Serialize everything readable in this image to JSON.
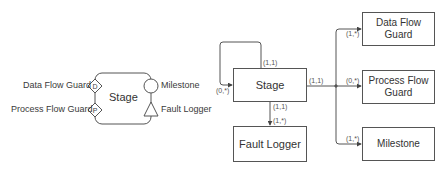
{
  "left_diagram": {
    "stage_label": "Stage",
    "ports": {
      "data_flow_guard": {
        "label": "Data Flow Guard",
        "glyph": "D",
        "shape": "diamond"
      },
      "process_flow_guard": {
        "label": "Process Flow Guard",
        "glyph": "P",
        "shape": "diamond"
      },
      "milestone": {
        "label": "Milestone",
        "shape": "circle"
      },
      "fault_logger": {
        "label": "Fault Logger",
        "shape": "triangle"
      }
    }
  },
  "right_diagram": {
    "stage": {
      "label": "Stage"
    },
    "fault_logger": {
      "label": "Fault Logger"
    },
    "data_flow_guard": {
      "label": "Data Flow Guard"
    },
    "process_flow_guard": {
      "label": "Process Flow Guard"
    },
    "milestone": {
      "label": "Milestone"
    },
    "cardinalities": {
      "self_loop_source": "(1,1)",
      "self_loop_target": "(0,*)",
      "stage_to_fault_source": "(1,1)",
      "stage_to_fault_target": "(1,*)",
      "stage_to_children_source": "(1,1)",
      "to_data_flow_guard": "(1,*)",
      "to_process_flow_guard": "(0,*)",
      "to_milestone": "(1,*)"
    }
  },
  "colors": {
    "stroke": "#555555",
    "text": "#333333"
  }
}
